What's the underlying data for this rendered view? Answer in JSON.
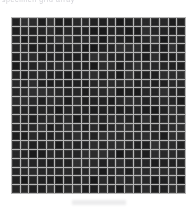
{
  "image": {
    "kind": "micrograph",
    "subject": "dark square micro-well / mesh grid array",
    "width_px": 196,
    "height_px": 209,
    "background_color": "#ffffff"
  },
  "top_caption": {
    "text": "specimen grid array",
    "note": "clipped at top edge, barely legible",
    "color": "#c9c9cf"
  },
  "specimen": {
    "label": "grid-array",
    "columns": 20,
    "rows": 20,
    "cell_count": 400,
    "origin_x_px": 11,
    "origin_y_px": 17,
    "width_px": 175,
    "height_px": 177,
    "cell_pitch_px": 9,
    "gridline_width_px": 1,
    "gridline_color": "#b6b6b6",
    "cell_fill_color": "#141414",
    "frame_color": "#b3b3b3"
  },
  "bottom_mark": {
    "label": "faint smudge",
    "color": "#d4d4d8"
  }
}
